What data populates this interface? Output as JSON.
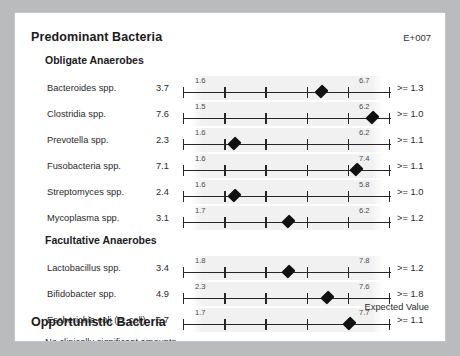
{
  "header": {
    "title": "Predominant Bacteria",
    "units": "E+007"
  },
  "groups": [
    {
      "label": "Obligate Anaerobes"
    },
    {
      "label": "Facultative Anaerobes"
    },
    {
      "label": "Opportunistic Bacteria"
    }
  ],
  "footer": {
    "note": "No clinically significant amounts.",
    "expected_value_label": "Expected Value"
  },
  "chart_data": {
    "type": "scatter",
    "title": "Predominant Bacteria",
    "units": "E+007",
    "xlabel": "",
    "ylabel": "",
    "axis_ticks": 6,
    "axis_range_note": "Each row has its own scale labelled by low and high endpoint values",
    "legend": [
      "Expected Value"
    ],
    "sections": [
      {
        "name": "Obligate Anaerobes",
        "rows": [
          {
            "name": "Bacteroides spp.",
            "value": "3.7",
            "low": "1.6",
            "high": "6.7",
            "reference": ">= 1.3",
            "marker_pct": 67
          },
          {
            "name": "Clostridia spp.",
            "value": "7.6",
            "low": "1.5",
            "high": "6.2",
            "reference": ">= 1.0",
            "marker_pct": 92
          },
          {
            "name": "Prevotella spp.",
            "value": "2.3",
            "low": "1.6",
            "high": "6.2",
            "reference": ">= 1.1",
            "marker_pct": 25
          },
          {
            "name": "Fusobacteria spp.",
            "value": "7.1",
            "low": "1.6",
            "high": "7.4",
            "reference": ">= 1.1",
            "marker_pct": 84
          },
          {
            "name": "Streptomyces spp.",
            "value": "2.4",
            "low": "1.6",
            "high": "5.8",
            "reference": ">= 1.0",
            "marker_pct": 25
          },
          {
            "name": "Mycoplasma spp.",
            "value": "3.1",
            "low": "1.7",
            "high": "6.2",
            "reference": ">= 1.2",
            "marker_pct": 51
          }
        ]
      },
      {
        "name": "Facultative Anaerobes",
        "rows": [
          {
            "name": "Lactobacillus spp.",
            "value": "3.4",
            "low": "1.8",
            "high": "7.8",
            "reference": ">= 1.2",
            "marker_pct": 51
          },
          {
            "name": "Bifidobacter spp.",
            "value": "4.9",
            "low": "2.3",
            "high": "7.6",
            "reference": ">= 1.8",
            "marker_pct": 70
          },
          {
            "name": "Escherichia coli (E. coli)",
            "value": "6.7",
            "low": "1.7",
            "high": "7.7",
            "reference": ">= 1.1",
            "marker_pct": 81
          }
        ]
      },
      {
        "name": "Opportunistic Bacteria",
        "rows": []
      }
    ]
  }
}
